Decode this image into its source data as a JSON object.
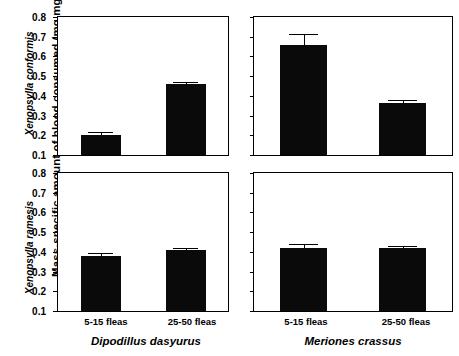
{
  "chart_data": {
    "type": "bar",
    "title": "",
    "subtitle": "",
    "ylabel": "Mass-specific amount of blood consumed (mg mg",
    "ylabel_sup": "-1",
    "ylabel_tail": ")",
    "xlabel": "",
    "ylim": [
      0.1,
      0.8
    ],
    "yticks": [
      0.1,
      0.2,
      0.3,
      0.4,
      0.5,
      0.6,
      0.7,
      0.8
    ],
    "ytick_labels": [
      "0.1",
      "0.2",
      "0.3",
      "0.4",
      "0.5",
      "0.6",
      "0.7",
      "0.8"
    ],
    "grid": false,
    "legend": "none",
    "categories": [
      "5-15 fleas",
      "25-50 fleas"
    ],
    "row_labels": [
      "Xenopsylla conformis",
      "Xenopsylla ramesis"
    ],
    "column_labels": [
      "Dipodillus dasyurus",
      "Meriones crassus"
    ],
    "bar_color": "#0a0a0a",
    "error_bar_style": "upper-only-with-cap",
    "panels": [
      {
        "id": "top-left",
        "row": "Xenopsylla conformis",
        "column": "Dipodillus dasyurus",
        "categories": [
          "5-15 fleas",
          "25-50 fleas"
        ],
        "values": [
          0.202,
          0.461
        ],
        "errors": [
          0.014,
          0.011
        ]
      },
      {
        "id": "top-right",
        "row": "Xenopsylla conformis",
        "column": "Meriones crassus",
        "categories": [
          "5-15 fleas",
          "25-50 fleas"
        ],
        "values": [
          0.659,
          0.366
        ],
        "errors": [
          0.057,
          0.014
        ]
      },
      {
        "id": "bottom-left",
        "row": "Xenopsylla ramesis",
        "column": "Dipodillus dasyurus",
        "categories": [
          "5-15 fleas",
          "25-50 fleas"
        ],
        "values": [
          0.381,
          0.411
        ],
        "errors": [
          0.013,
          0.008
        ]
      },
      {
        "id": "bottom-right",
        "row": "Xenopsylla ramesis",
        "column": "Meriones crassus",
        "categories": [
          "5-15 fleas",
          "25-50 fleas"
        ],
        "values": [
          0.421,
          0.418
        ],
        "errors": [
          0.021,
          0.012
        ]
      }
    ]
  },
  "axis": {
    "y_title_main": "Mass-specific amount of blood consumed (mg mg",
    "y_title_sup": "-1",
    "y_title_close": ")",
    "y_sub_top": "Xenopsylla conformis",
    "y_sub_bottom": "Xenopsylla ramesis",
    "tick_labels": [
      "0.8",
      "0.7",
      "0.6",
      "0.5",
      "0.4",
      "0.3",
      "0.2",
      "0.1"
    ]
  },
  "x_captions": {
    "left_group": "Dipodillus dasyurus",
    "right_group": "Meriones crassus",
    "cat_1": "5-15 fleas",
    "cat_2": "25-50 fleas"
  }
}
